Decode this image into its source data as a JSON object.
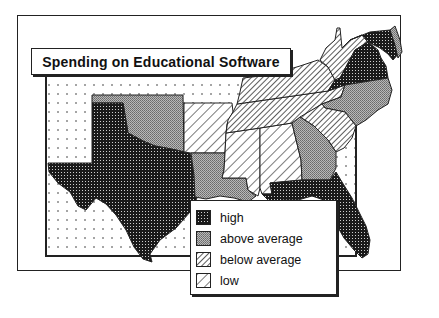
{
  "title": "Spending on Educational Software",
  "legend": {
    "items": [
      {
        "key": "high",
        "label": "high",
        "pattern": "dense-dark-dots"
      },
      {
        "key": "above_average",
        "label": "above average",
        "pattern": "gray-stipple"
      },
      {
        "key": "below_average",
        "label": "below average",
        "pattern": "fine-diagonal-hatch"
      },
      {
        "key": "low",
        "label": "low",
        "pattern": "wide-diagonal-hatch"
      }
    ]
  },
  "regions": [
    {
      "state": "Texas",
      "category": "high"
    },
    {
      "state": "Oklahoma",
      "category": "above_average"
    },
    {
      "state": "Arkansas",
      "category": "low"
    },
    {
      "state": "Louisiana",
      "category": "above_average"
    },
    {
      "state": "Mississippi",
      "category": "low"
    },
    {
      "state": "Alabama",
      "category": "low"
    },
    {
      "state": "Georgia",
      "category": "above_average"
    },
    {
      "state": "Florida",
      "category": "high"
    },
    {
      "state": "South Carolina",
      "category": "below_average"
    },
    {
      "state": "North Carolina",
      "category": "above_average"
    },
    {
      "state": "Tennessee",
      "category": "below_average"
    },
    {
      "state": "Kentucky",
      "category": "below_average"
    },
    {
      "state": "Virginia",
      "category": "high"
    },
    {
      "state": "West Virginia",
      "category": "below_average"
    },
    {
      "state": "Maryland",
      "category": "high"
    },
    {
      "state": "Delaware",
      "category": "above_average"
    }
  ],
  "colors": {
    "ink": "#222222",
    "background": "#ffffff",
    "gray": "#9a9a9a"
  }
}
